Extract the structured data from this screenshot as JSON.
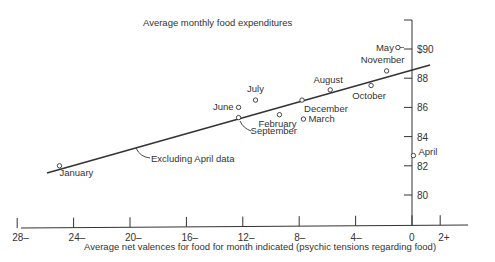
{
  "chart_data": {
    "type": "scatter",
    "title": "Average monthly food expenditures",
    "xlabel": "Average net valences for food for month indicated (psychic tensions regarding food)",
    "ylabel": "Average monthly food expenditures",
    "x_tick_labels": [
      "28–",
      "24–",
      "20–",
      "16–",
      "12–",
      "8–",
      "4–",
      "0",
      "2+"
    ],
    "x_tick_values": [
      -28,
      -24,
      -20,
      -16,
      -12,
      -8,
      -4,
      0,
      2
    ],
    "y_tick_labels": [
      "$90",
      "88",
      "86",
      "84",
      "82",
      "80"
    ],
    "y_tick_values": [
      90,
      88,
      86,
      84,
      82,
      80
    ],
    "xlim": [
      -28,
      2
    ],
    "ylim": [
      78.5,
      92
    ],
    "grid": false,
    "legend": null,
    "points": [
      {
        "label": "May",
        "x": -1.0,
        "y": 90.1
      },
      {
        "label": "November",
        "x": -1.8,
        "y": 88.5
      },
      {
        "label": "October",
        "x": -2.9,
        "y": 87.5
      },
      {
        "label": "August",
        "x": -5.8,
        "y": 87.2
      },
      {
        "label": "December",
        "x": -7.8,
        "y": 86.5
      },
      {
        "label": "March",
        "x": -7.7,
        "y": 85.2
      },
      {
        "label": "February",
        "x": -9.4,
        "y": 85.5
      },
      {
        "label": "July",
        "x": -11.1,
        "y": 86.5
      },
      {
        "label": "June",
        "x": -12.3,
        "y": 86.0
      },
      {
        "label": "September",
        "x": -12.3,
        "y": 85.3
      },
      {
        "label": "January",
        "x": -25.0,
        "y": 82.0
      },
      {
        "label": "April",
        "x": 0.1,
        "y": 82.7
      }
    ],
    "series": [
      {
        "name": "Excluding April data",
        "type": "line",
        "x": [
          -26.3,
          1.3
        ],
        "y": [
          81.5,
          88.9
        ]
      }
    ],
    "annotations": [
      "Excluding April data",
      "September"
    ]
  }
}
